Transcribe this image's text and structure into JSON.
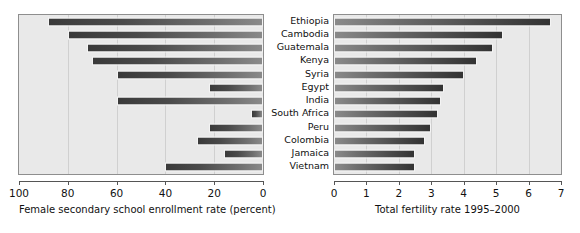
{
  "chart_data": [
    {
      "type": "bar",
      "orientation": "horizontal",
      "title": "",
      "xlabel": "Female secondary school enrollment rate (percent)",
      "ylabel": "",
      "xlim": [
        100,
        0
      ],
      "reversed_x_axis": true,
      "grid": true,
      "legend": "none",
      "xticks": [
        "100",
        "80",
        "60",
        "40",
        "20",
        "0"
      ],
      "xtick_values": [
        100,
        80,
        60,
        40,
        20,
        0
      ],
      "categories": [
        "Ethiopia",
        "Cambodia",
        "Guatemala",
        "Kenya",
        "Syria",
        "Egypt",
        "India",
        "South Africa",
        "Peru",
        "Colombia",
        "Jamaica",
        "Vietnam"
      ],
      "values": [
        12,
        20,
        28,
        30,
        40,
        78,
        40,
        95,
        78,
        73,
        84,
        60
      ]
    },
    {
      "type": "bar",
      "orientation": "horizontal",
      "title": "",
      "xlabel": "Total fertility rate 1995–2000",
      "ylabel": "",
      "xlim": [
        0,
        7
      ],
      "reversed_x_axis": false,
      "grid": true,
      "legend": "none",
      "xticks": [
        "0",
        "1",
        "2",
        "3",
        "4",
        "5",
        "6",
        "7"
      ],
      "xtick_values": [
        0,
        1,
        2,
        3,
        4,
        5,
        6,
        7
      ],
      "categories": [
        "Ethiopia",
        "Cambodia",
        "Guatemala",
        "Kenya",
        "Syria",
        "Egypt",
        "India",
        "South Africa",
        "Peru",
        "Colombia",
        "Jamaica",
        "Vietnam"
      ],
      "values": [
        6.7,
        5.2,
        4.9,
        4.4,
        4.0,
        3.4,
        3.3,
        3.2,
        3.0,
        2.8,
        2.5,
        2.5
      ]
    }
  ],
  "colors": {
    "panel_background": "#e9e9e9",
    "panel_border": "#8e8e8e",
    "gridline": "#d0d0d0",
    "bar_dark": "#333333",
    "bar_light": "#8a8a8a",
    "axis": "#555555",
    "text": "#111111",
    "page_background": "#ffffff"
  }
}
